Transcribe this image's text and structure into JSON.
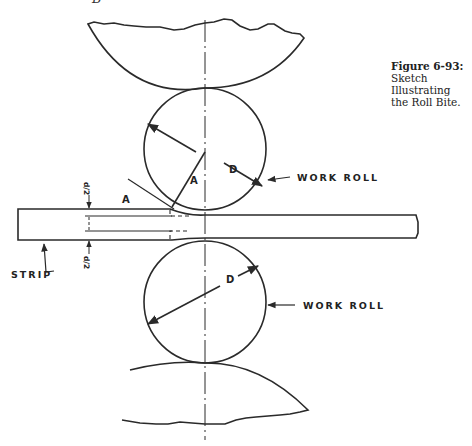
{
  "header_fragment": "B",
  "caption": {
    "number": "Figure 6-93:",
    "lines": [
      "Sketch",
      "Illustrating",
      "the Roll Bite."
    ]
  },
  "labels": {
    "upper_work_roll": "WORK ROLL",
    "lower_work_roll": "WORK ROLL",
    "strip": "STRIP",
    "diameter_upper": "D",
    "diameter_lower": "D",
    "angle_inner": "A",
    "angle_outer": "A",
    "half_thickness_top": "d/2",
    "half_thickness_bottom": "d/2"
  },
  "colors": {
    "ink": "#2a2a2a",
    "background": "#ffffff"
  }
}
